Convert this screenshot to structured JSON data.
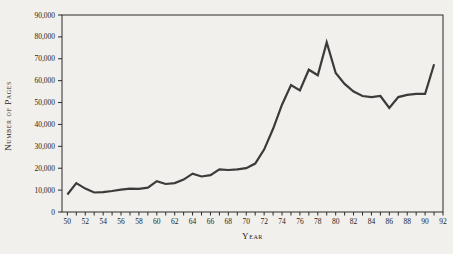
{
  "figure": {
    "type": "line-chart-figure",
    "background": "#f1f0ec"
  },
  "chart_data": {
    "type": "line",
    "title": "",
    "xlabel": "Year",
    "ylabel": "Number of Pages",
    "xlim": [
      1949.4,
      1992
    ],
    "ylim": [
      0,
      90000
    ],
    "x_tick_interval_years": 1,
    "x_label_interval_years": 2,
    "x_label_style": "two-digit-year",
    "y_tick_interval": 10000,
    "grid": false,
    "legend": "none",
    "line_color": "#3b3b3b",
    "frame_color": "#2a2a2a",
    "x": [
      1950,
      1951,
      1952,
      1953,
      1954,
      1955,
      1956,
      1957,
      1958,
      1959,
      1960,
      1961,
      1962,
      1963,
      1964,
      1965,
      1966,
      1967,
      1968,
      1969,
      1970,
      1971,
      1972,
      1973,
      1974,
      1975,
      1976,
      1977,
      1978,
      1979,
      1980,
      1981,
      1982,
      1983,
      1984,
      1985,
      1986,
      1987,
      1988,
      1989,
      1990,
      1991
    ],
    "values": [
      8000,
      13200,
      10700,
      8900,
      9100,
      9600,
      10200,
      10700,
      10600,
      11100,
      14100,
      12800,
      13200,
      14800,
      17500,
      16200,
      16800,
      19500,
      19200,
      19500,
      20000,
      22100,
      28500,
      38000,
      49000,
      58000,
      55500,
      65000,
      62500,
      77500,
      63500,
      58500,
      55000,
      53000,
      52500,
      53000,
      47500,
      52500,
      53500,
      54000,
      54000,
      67500
    ],
    "y_tick_labels": [
      "0",
      "10,000",
      "20,000",
      "30,000",
      "40,000",
      "50,000",
      "60,000",
      "70,000",
      "80,000",
      "90,000"
    ],
    "x_tick_labels": [
      "50",
      "52",
      "54",
      "56",
      "58",
      "60",
      "62",
      "64",
      "66",
      "68",
      "70",
      "72",
      "74",
      "76",
      "78",
      "80",
      "82",
      "84",
      "86",
      "88",
      "90",
      "92"
    ]
  }
}
